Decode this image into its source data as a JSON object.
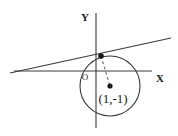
{
  "figure": {
    "background_color": "#ffffff",
    "stroke_color": "#3a3a3a",
    "dash_color": "#5a5a5a",
    "text_color": "#1a1a1a",
    "width": 178,
    "height": 136
  },
  "axes": {
    "x_label": "X",
    "y_label": "Y",
    "origin_label": "O",
    "x_axis": {
      "x1": 14,
      "y1": 71,
      "x2": 152,
      "y2": 71
    },
    "y_axis": {
      "x1": 96,
      "y1": 13,
      "x2": 96,
      "y2": 128
    },
    "x_label_pos": {
      "x": 160,
      "y": 82
    },
    "y_label_pos": {
      "x": 85,
      "y": 21
    },
    "origin_label_pos": {
      "x": 85,
      "y": 80
    }
  },
  "circle": {
    "center_x": 110,
    "center_y": 86,
    "radius": 30,
    "center_point_radius": 2.6,
    "label": "(1,-1)",
    "label_pos": {
      "x": 113,
      "y": 103
    }
  },
  "tangent_line": {
    "x1": 10,
    "y1": 73,
    "x2": 171,
    "y2": 38,
    "point_x": 101,
    "point_y": 56,
    "point_radius": 2.8
  },
  "radius_segment": {
    "x1": 101,
    "y1": 56,
    "x2": 110,
    "y2": 86,
    "dash_pattern": "3,2.5"
  }
}
